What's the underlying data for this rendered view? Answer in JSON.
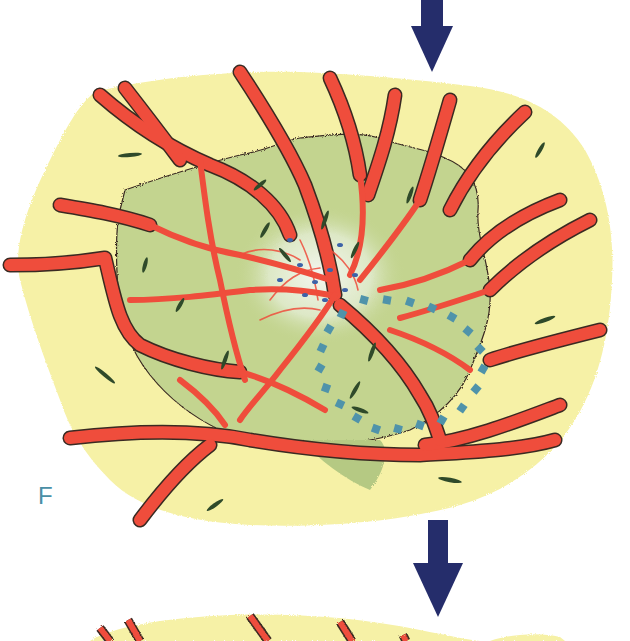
{
  "figure": {
    "panel_label": "F",
    "colors": {
      "background": "#ffffff",
      "tissue_yellow": "#f6f1a6",
      "tissue_yellow_light": "#fbf8cf",
      "lesion_green": "#c3d48f",
      "lesion_green_dark": "#9fb46a",
      "lesion_center": "#eef3e4",
      "vessel_red": "#ef4d3c",
      "vessel_outline": "#3a2a22",
      "cell_nuclei": "#2f4a2a",
      "blue_dots": "#3d63a8",
      "dotted_outline": "#4f93aa",
      "arrow_navy": "#252d6b",
      "label_teal": "#4a8fa6"
    },
    "arrows": [
      {
        "name": "top-arrow",
        "direction": "down"
      },
      {
        "name": "middle-arrow",
        "direction": "down"
      }
    ]
  }
}
